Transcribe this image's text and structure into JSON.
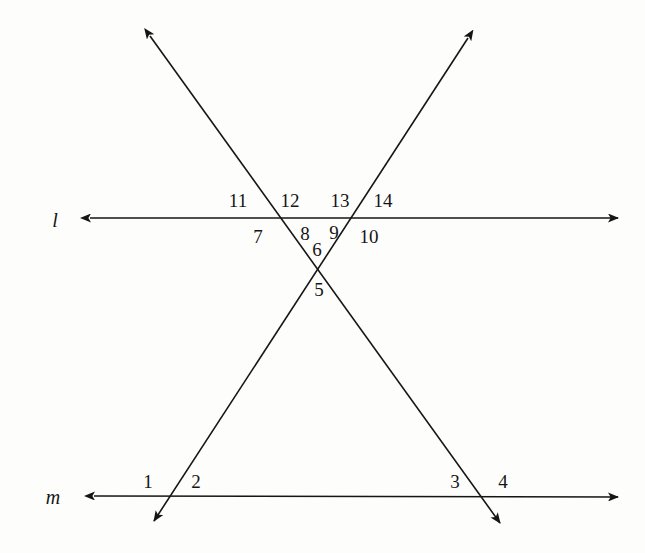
{
  "figure": {
    "background_color": "#fdfdfc",
    "stroke_color": "#151515",
    "stroke_width": 1.6,
    "width": 645,
    "height": 553
  },
  "lines": [
    {
      "name": "line-l",
      "label": "l",
      "label_x": 55,
      "label_y": 220,
      "x1": 90,
      "y1": 218,
      "x2": 618,
      "y2": 218,
      "arrow_start": true,
      "arrow_end": true
    },
    {
      "name": "line-m",
      "label": "m",
      "label_x": 53,
      "label_y": 497,
      "x1": 94,
      "y1": 496,
      "x2": 618,
      "y2": 497,
      "arrow_start": true,
      "arrow_end": true
    },
    {
      "name": "transversal-left",
      "label": "",
      "label_x": 0,
      "label_y": 0,
      "x1": 150,
      "y1": 36,
      "x2": 500,
      "y2": 523,
      "arrow_start": true,
      "arrow_end": true
    },
    {
      "name": "transversal-right",
      "label": "",
      "label_x": 0,
      "label_y": 0,
      "x1": 468,
      "y1": 38,
      "x2": 154,
      "y2": 521,
      "arrow_start": true,
      "arrow_end": true
    }
  ],
  "angle_labels": [
    {
      "text": "11",
      "x": 238,
      "y": 200
    },
    {
      "text": "12",
      "x": 290,
      "y": 200
    },
    {
      "text": "13",
      "x": 340,
      "y": 200
    },
    {
      "text": "14",
      "x": 383,
      "y": 200
    },
    {
      "text": "7",
      "x": 258,
      "y": 236
    },
    {
      "text": "8",
      "x": 305,
      "y": 233
    },
    {
      "text": "9",
      "x": 334,
      "y": 232
    },
    {
      "text": "10",
      "x": 369,
      "y": 236
    },
    {
      "text": "6",
      "x": 317,
      "y": 249
    },
    {
      "text": "5",
      "x": 319,
      "y": 289
    },
    {
      "text": "1",
      "x": 148,
      "y": 481
    },
    {
      "text": "2",
      "x": 196,
      "y": 481
    },
    {
      "text": "3",
      "x": 455,
      "y": 481
    },
    {
      "text": "4",
      "x": 503,
      "y": 481
    }
  ],
  "intersections": [
    {
      "name": "left-transversal-with-l",
      "x": 290,
      "y": 218
    },
    {
      "name": "right-transversal-with-l",
      "x": 345,
      "y": 218
    },
    {
      "name": "transversals-crossing",
      "x": 317,
      "y": 259
    },
    {
      "name": "right-transversal-with-m",
      "x": 170,
      "y": 496
    },
    {
      "name": "left-transversal-with-m",
      "x": 480,
      "y": 496
    }
  ]
}
